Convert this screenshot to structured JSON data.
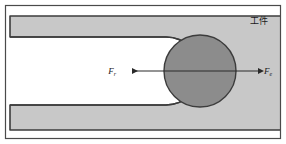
{
  "figure": {
    "name": "milling-slot-force-diagram",
    "canvas": {
      "width": 286,
      "height": 144
    },
    "background_color": "#ffffff",
    "frame": {
      "name": "outer-frame",
      "stroke_color": "#4a4a4a",
      "fill_color": "#ffffff",
      "x": 5,
      "y": 5,
      "width": 276,
      "height": 134
    },
    "workpiece": {
      "label": "工件",
      "label_x": 250,
      "label_y": 22,
      "fill_color": "#c8c8c8",
      "stroke_color": "#3c3c3c",
      "upper_arm": {
        "x": 10,
        "y": 16,
        "width": 266,
        "height": 21
      },
      "lower_arm": {
        "x": 10,
        "y": 105,
        "width": 266,
        "height": 25
      },
      "slot": {
        "name": "u-slot",
        "fill_color": "#ffffff",
        "left_x": 10,
        "right_center_x": 200,
        "top_y": 37,
        "bottom_y": 105,
        "corner_radius": 34
      }
    },
    "cutter": {
      "name": "rotating-cutter",
      "center_x": 200,
      "center_y": 71,
      "radius": 36,
      "fill_color": "#8c8c8c",
      "stroke_color": "#3c3c3c"
    },
    "forces": [
      {
        "name": "radial-force-left",
        "symbol": "F",
        "subscript": "r",
        "direction": "left",
        "label_x": 116,
        "label_y": 74,
        "arrow_tail_x": 200,
        "arrow_head_x": 132,
        "arrow_y": 71,
        "color": "#2a2a2a"
      },
      {
        "name": "feed-force-right",
        "symbol": "F",
        "subscript": "e",
        "direction": "right",
        "label_x": 264,
        "label_y": 74,
        "arrow_tail_x": 200,
        "arrow_head_x": 258,
        "arrow_y": 71,
        "color": "#2a2a2a"
      }
    ]
  }
}
